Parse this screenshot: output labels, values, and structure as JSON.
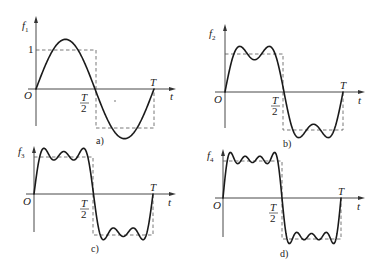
{
  "figure": {
    "panels": [
      {
        "id": "a",
        "caption": "a)",
        "function_label": "f",
        "function_subscript": "1",
        "terms": 1,
        "origin_label": "O",
        "t_label": "t",
        "half_period_label_num": "T",
        "half_period_label_den": "2",
        "period_label": "T",
        "amplitude_label": "1"
      },
      {
        "id": "b",
        "caption": "b)",
        "function_label": "f",
        "function_subscript": "2",
        "terms": 2,
        "origin_label": "O",
        "t_label": "t",
        "half_period_label_num": "T",
        "half_period_label_den": "2",
        "period_label": "T"
      },
      {
        "id": "c",
        "caption": "c)",
        "function_label": "f",
        "function_subscript": "3",
        "terms": 3,
        "origin_label": "O",
        "t_label": "t",
        "half_period_label_num": "T",
        "half_period_label_den": "2",
        "period_label": "T"
      },
      {
        "id": "d",
        "caption": "d)",
        "function_label": "f",
        "function_subscript": "4",
        "terms": 4,
        "origin_label": "O",
        "t_label": "t",
        "half_period_label_num": "T",
        "half_period_label_den": "2",
        "period_label": "T"
      }
    ],
    "colors": {
      "curve": "#1a1a1a",
      "axis": "#333333",
      "dashed_square": "#555555",
      "background": "#ffffff"
    }
  }
}
